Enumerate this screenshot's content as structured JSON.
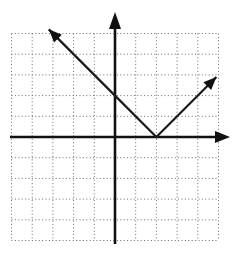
{
  "chart_data": {
    "type": "line",
    "title": "",
    "xlabel": "",
    "ylabel": "",
    "xlim": [
      -5,
      5
    ],
    "ylim": [
      -5,
      5
    ],
    "grid": true,
    "grid_style": "dotted",
    "grid_step": 1,
    "axes_arrows": true,
    "function": "y = |x - 2|",
    "series": [
      {
        "name": "absolute value graph",
        "x": [
          -3.2,
          0,
          2,
          4.9
        ],
        "y": [
          5.2,
          2,
          0,
          2.9
        ],
        "arrow_both_ends": true
      }
    ],
    "key_points": {
      "vertex": [
        2,
        0
      ],
      "y_intercept": [
        0,
        2
      ],
      "left_arrow_tip": [
        -3.2,
        5.2
      ],
      "right_arrow_tip": [
        4.9,
        2.9
      ]
    },
    "colors": {
      "line": "#1a1a1a",
      "axis": "#111111",
      "grid": "#6a6a6a",
      "background": "#ffffff"
    }
  },
  "layout": {
    "origin_px": [
      115,
      137
    ],
    "unit_px": 20.7
  }
}
